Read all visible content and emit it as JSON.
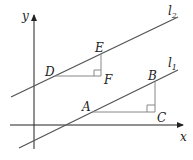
{
  "diagram": {
    "axes": {
      "x_label": "x",
      "y_label": "y"
    },
    "lines": [
      {
        "name": "l2",
        "label": "l",
        "subscript": "2"
      },
      {
        "name": "l1",
        "label": "l",
        "subscript": "1"
      }
    ],
    "points": {
      "A": "A",
      "B": "B",
      "C": "C",
      "D": "D",
      "E": "E",
      "F": "F"
    },
    "colors": {
      "line": "#444444",
      "helper": "#888888",
      "axis": "#222222"
    }
  }
}
